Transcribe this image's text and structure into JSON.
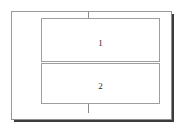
{
  "diagram": {
    "background_color": "#ffffff",
    "frame": {
      "name": "outer-frame",
      "border_color": "#9a9a9a",
      "fill_color": "#ffffff",
      "shadow_color": "#3c3c3c"
    },
    "center_axis": {
      "color": "#8d8d8d",
      "top_tick": "",
      "bottom_tick": ""
    },
    "panels": [
      {
        "label": "1",
        "border_color": "#9e9e9e",
        "fill_color": "#ffffff",
        "text_color": "#2b2b2b"
      },
      {
        "label": "2",
        "border_color": "#9e9e9e",
        "fill_color": "#ffffff",
        "text_color": "#2b2b2b"
      }
    ]
  }
}
